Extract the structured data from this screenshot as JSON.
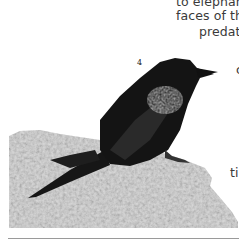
{
  "page": {
    "text_fragments": [
      "to  elephant",
      "faces of the",
      "predato",
      "c",
      "ti"
    ],
    "figure_number": "4",
    "figure": {
      "subject": "dark glossy bird perched on a lichen-covered rock",
      "style": "grayscale photograph"
    }
  }
}
